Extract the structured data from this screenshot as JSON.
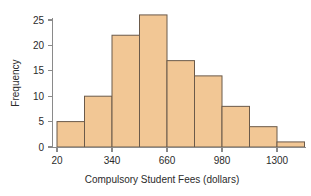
{
  "chart_data": {
    "type": "bar",
    "title": "",
    "subtitle": "",
    "xlabel": "Compulsory Student Fees (dollars)",
    "ylabel": "Frequency",
    "bin_width": 160,
    "bin_start": 20,
    "bin_edges": [
      20,
      180,
      340,
      500,
      660,
      820,
      980,
      1140,
      1300,
      1460
    ],
    "categories": [
      "20-180",
      "180-340",
      "340-500",
      "500-660",
      "660-820",
      "820-980",
      "980-1140",
      "1140-1300",
      "1300-1460"
    ],
    "values": [
      5,
      10,
      22,
      26,
      17,
      14,
      8,
      4,
      1
    ],
    "xlim": [
      20,
      1460
    ],
    "ylim": [
      0,
      27
    ],
    "x_ticks": [
      20,
      340,
      660,
      980,
      1300
    ],
    "x_tick_labels": [
      "20",
      "340",
      "660",
      "980",
      "1300"
    ],
    "y_ticks": [
      0,
      5,
      10,
      15,
      20,
      25
    ],
    "y_tick_labels": [
      "0",
      "5",
      "10",
      "15",
      "20",
      "25"
    ],
    "grid": false,
    "legend": false,
    "legend_position": "none",
    "colors": {
      "bar_fill": "#F2C795",
      "bar_stroke": "#6B5A4A",
      "axis": "#8A8A8A",
      "text": "#2B2B2B",
      "background": "#FFFFFF"
    }
  }
}
